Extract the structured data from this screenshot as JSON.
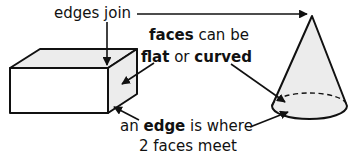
{
  "diagram": {
    "background_color": "#ffffff",
    "ink_color": "#111111",
    "shape_fill_light": "#eeeeee",
    "shape_fill_white": "#ffffff"
  },
  "labels": {
    "edges_join": "edges join",
    "faces_line1_bold": "faces",
    "faces_line1_rest": " can be",
    "faces_line2_bold1": "flat",
    "faces_line2_mid": " or ",
    "faces_line2_bold2": "curved",
    "edge_line1_pre": "an ",
    "edge_line1_bold": "edge",
    "edge_line1_post": " is where",
    "edge_line2": "2 faces meet"
  },
  "shapes": {
    "cuboid": {
      "name": "cuboid",
      "top_face_fill": "#eeeeee",
      "side_face_fill": "#eeeeee",
      "front_face_fill": "#ffffff"
    },
    "cone": {
      "name": "cone",
      "body_fill": "#eeeeee",
      "hidden_edge_style": "dashed"
    }
  },
  "annotations": {
    "arrow_to_cuboid_corner": "edges join points to cuboid top corner",
    "arrow_to_cone_apex": "edges join points to cone apex",
    "arrow_to_cuboid_face": "faces arrow points to cuboid side face",
    "arrow_to_cone_face": "curved arrow points to cone curved face",
    "arrow_to_cuboid_edge": "an edge arrow points to cuboid bottom edge",
    "arrow_to_cone_edge": "an edge arrow points to cone base edge"
  }
}
